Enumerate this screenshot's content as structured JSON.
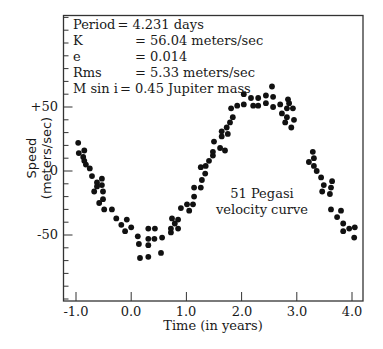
{
  "chart_data": {
    "type": "scatter",
    "title": "",
    "xlabel": "Time (in years)",
    "ylabel": "Speed (meters/sec)",
    "xlim": [
      -1.2,
      4.2
    ],
    "ylim": [
      -102,
      122
    ],
    "x_ticks": [
      -1.0,
      0.0,
      1.0,
      2.0,
      3.0,
      4.0
    ],
    "x_tick_labels": [
      "-1.0",
      "0.0",
      "1.0",
      "2.0",
      "3.0",
      "4.0"
    ],
    "y_ticks": [
      50,
      0,
      -50
    ],
    "y_tick_labels": [
      "+50",
      "0",
      "-50"
    ],
    "y_minor_tick_step": 10,
    "grid": false,
    "legend": null,
    "annotations": [
      {
        "text": "51 Pegasi",
        "x": 2.35,
        "y": -19
      },
      {
        "text": "velocity curve",
        "x": 2.35,
        "y": -31
      }
    ],
    "stats_box": [
      {
        "key": "Period",
        "value": "= 4.231 days"
      },
      {
        "key": "K",
        "value": "= 56.04 meters/sec"
      },
      {
        "key": "e",
        "value": "= 0.014"
      },
      {
        "key": "Rms",
        "value": "= 5.33 meters/sec"
      },
      {
        "key": "M sin i",
        "value": "= 0.45 Jupiter mass"
      }
    ],
    "series": [
      {
        "name": "51 Pegasi radial velocity",
        "marker": "filled-circle",
        "color": "#111111",
        "points": [
          [
            -0.96,
            22
          ],
          [
            -0.95,
            14
          ],
          [
            -0.85,
            16
          ],
          [
            -0.87,
            11
          ],
          [
            -0.85,
            8
          ],
          [
            -0.82,
            5
          ],
          [
            -0.75,
            2
          ],
          [
            -0.71,
            -4
          ],
          [
            -0.62,
            -9
          ],
          [
            -0.53,
            -6
          ],
          [
            -0.62,
            -12
          ],
          [
            -0.53,
            -11
          ],
          [
            -0.67,
            -16
          ],
          [
            -0.51,
            -16
          ],
          [
            -0.51,
            -22
          ],
          [
            -0.58,
            -25
          ],
          [
            -0.49,
            -30
          ],
          [
            -0.35,
            -30
          ],
          [
            -0.27,
            -37
          ],
          [
            -0.18,
            -42
          ],
          [
            -0.08,
            -38
          ],
          [
            -0.11,
            -47
          ],
          [
            0.0,
            -44
          ],
          [
            0.12,
            -51
          ],
          [
            0.14,
            -57
          ],
          [
            0.16,
            -68
          ],
          [
            0.31,
            -45
          ],
          [
            0.31,
            -53
          ],
          [
            0.31,
            -58
          ],
          [
            0.31,
            -67
          ],
          [
            0.43,
            -45
          ],
          [
            0.42,
            -53
          ],
          [
            0.56,
            -52
          ],
          [
            0.54,
            -64
          ],
          [
            0.72,
            -48
          ],
          [
            0.72,
            -45
          ],
          [
            0.85,
            -45
          ],
          [
            0.79,
            -41
          ],
          [
            0.74,
            -37
          ],
          [
            0.85,
            -38
          ],
          [
            0.9,
            -29
          ],
          [
            1.05,
            -31
          ],
          [
            1.01,
            -26
          ],
          [
            1.12,
            -26
          ],
          [
            1.14,
            -20
          ],
          [
            1.14,
            -13
          ],
          [
            1.26,
            -13
          ],
          [
            1.28,
            -7
          ],
          [
            1.34,
            -2
          ],
          [
            1.26,
            3
          ],
          [
            1.35,
            4
          ],
          [
            1.41,
            8
          ],
          [
            1.48,
            12
          ],
          [
            1.48,
            15
          ],
          [
            1.5,
            23
          ],
          [
            1.61,
            18
          ],
          [
            1.7,
            16
          ],
          [
            1.64,
            27
          ],
          [
            1.75,
            29
          ],
          [
            1.64,
            31
          ],
          [
            1.73,
            34
          ],
          [
            1.79,
            38
          ],
          [
            1.84,
            42
          ],
          [
            1.81,
            49
          ],
          [
            1.92,
            51
          ],
          [
            2.04,
            52
          ],
          [
            2.04,
            60
          ],
          [
            2.17,
            57
          ],
          [
            2.3,
            57
          ],
          [
            2.21,
            51
          ],
          [
            2.3,
            51
          ],
          [
            2.44,
            59
          ],
          [
            2.44,
            53
          ],
          [
            2.55,
            66
          ],
          [
            2.57,
            58
          ],
          [
            2.57,
            50
          ],
          [
            2.7,
            52
          ],
          [
            2.84,
            56
          ],
          [
            2.86,
            53
          ],
          [
            2.82,
            49
          ],
          [
            2.93,
            49
          ],
          [
            2.73,
            45
          ],
          [
            2.82,
            42
          ],
          [
            2.95,
            40
          ],
          [
            2.79,
            38
          ],
          [
            2.9,
            34
          ],
          [
            3.29,
            15
          ],
          [
            3.22,
            7
          ],
          [
            3.31,
            10
          ],
          [
            3.31,
            4
          ],
          [
            3.36,
            0
          ],
          [
            3.44,
            -5
          ],
          [
            3.49,
            -11
          ],
          [
            3.64,
            -8
          ],
          [
            3.62,
            -13
          ],
          [
            3.46,
            -16
          ],
          [
            3.6,
            -18
          ],
          [
            3.62,
            -30
          ],
          [
            3.8,
            -31
          ],
          [
            3.73,
            -36
          ],
          [
            3.84,
            -41
          ],
          [
            3.84,
            -47
          ],
          [
            3.95,
            -45
          ],
          [
            4.05,
            -44
          ],
          [
            4.04,
            -52
          ]
        ]
      }
    ]
  }
}
